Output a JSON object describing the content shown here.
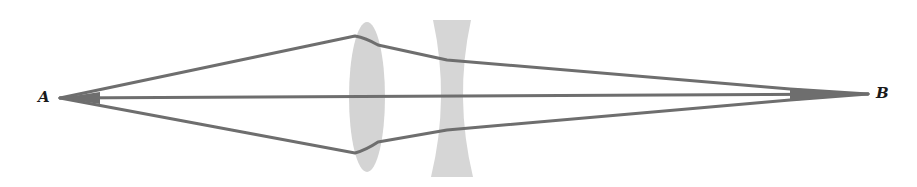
{
  "diagram": {
    "type": "optics-ray-diagram",
    "labels": {
      "point_a": "A",
      "point_b": "B"
    },
    "elements": [
      {
        "name": "converging-lens",
        "shape": "biconvex",
        "fill": "#d4d4d4",
        "cx": 367,
        "cy": 97,
        "rx": 18,
        "ry": 75
      },
      {
        "name": "diverging-lens",
        "shape": "biconcave",
        "fill": "#d6d6d6",
        "top_y": 20,
        "bottom_y": 177,
        "outer_left": 433,
        "outer_right": 473,
        "waist_left": 447,
        "waist_right": 457
      }
    ],
    "rays": [
      {
        "name": "upper-ray",
        "points": [
          [
            60,
            98
          ],
          [
            355,
            36
          ],
          [
            378,
            45
          ],
          [
            447,
            60
          ],
          [
            790,
            89
          ],
          [
            868,
            94
          ]
        ]
      },
      {
        "name": "axial-ray",
        "points": [
          [
            60,
            98
          ],
          [
            868,
            94
          ]
        ]
      },
      {
        "name": "lower-ray",
        "points": [
          [
            60,
            98
          ],
          [
            355,
            153
          ],
          [
            378,
            142
          ],
          [
            447,
            130
          ],
          [
            790,
            100
          ],
          [
            868,
            94
          ]
        ]
      }
    ],
    "colors": {
      "ray": "#6e6e6e",
      "lens": "#d4d4d4",
      "background": "#ffffff",
      "label": "#1a1a1a"
    }
  }
}
